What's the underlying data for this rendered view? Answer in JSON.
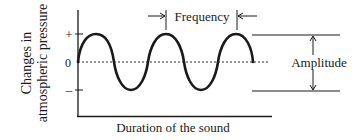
{
  "diagram": {
    "y_axis_label_line1": "Changes in",
    "y_axis_label_line2": "atmospheric pressure",
    "x_axis_label": "Duration of the sound",
    "tick_plus": "+",
    "tick_zero": "0",
    "tick_minus": "–",
    "frequency_label": "Frequency",
    "amplitude_label": "Amplitude",
    "colors": {
      "ink": "#1a1a1a",
      "background": "#ffffff"
    }
  }
}
